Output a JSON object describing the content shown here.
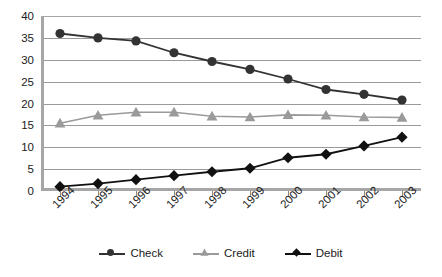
{
  "chart_data": {
    "type": "line",
    "title": "",
    "subtitle": "",
    "xlabel": "",
    "ylabel": "",
    "categories": [
      "1994",
      "1995",
      "1996",
      "1997",
      "1998",
      "1999",
      "2000",
      "2001",
      "2002",
      "2003"
    ],
    "series": [
      {
        "name": "Check",
        "marker": "circle",
        "color": "#333333",
        "values": [
          36.0,
          35.0,
          34.3,
          31.6,
          29.6,
          27.8,
          25.6,
          23.2,
          22.1,
          20.8
        ]
      },
      {
        "name": "Credit",
        "marker": "triangle",
        "color": "#9a9a9a",
        "values": [
          15.5,
          17.3,
          18.0,
          18.0,
          17.1,
          16.9,
          17.4,
          17.3,
          16.9,
          16.8
        ]
      },
      {
        "name": "Debit",
        "marker": "diamond",
        "color": "#111111",
        "values": [
          1.0,
          1.7,
          2.6,
          3.5,
          4.4,
          5.2,
          7.6,
          8.4,
          10.3,
          12.3
        ]
      }
    ],
    "ylim": [
      0,
      40
    ],
    "yticks": [
      0,
      5,
      10,
      15,
      20,
      25,
      30,
      35,
      40
    ],
    "ytick_labels": [
      "0",
      "5",
      "10",
      "15",
      "20",
      "25",
      "30",
      "35",
      "40"
    ],
    "grid": true,
    "grid_axis": "y",
    "legend_position": "bottom",
    "legend_entries": [
      "Check",
      "Credit",
      "Debit"
    ],
    "colors": {
      "check": "#333333",
      "credit": "#9a9a9a",
      "debit": "#111111",
      "gridline": "#9a9a9a",
      "axis": "#a6a6a6",
      "text": "#1b1b1b",
      "background": "#ffffff"
    }
  }
}
